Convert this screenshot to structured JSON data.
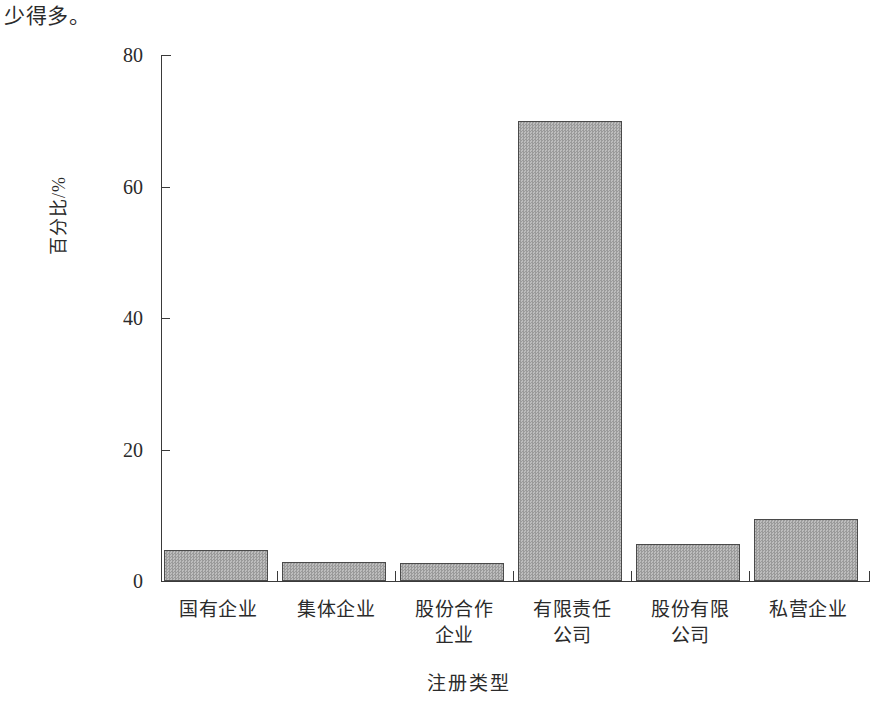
{
  "document": {
    "body_text": "少得多。"
  },
  "chart_data": {
    "type": "bar",
    "title": "",
    "xlabel": "注册类型",
    "ylabel": "百分比/%",
    "categories": [
      "国有企业",
      "集体企业",
      "股份合作企业",
      "有限责任公司",
      "股份有限公司",
      "私营企业"
    ],
    "category_lines": [
      [
        "国有企业"
      ],
      [
        "集体企业"
      ],
      [
        "股份合作",
        "企业"
      ],
      [
        "有限责任",
        "公司"
      ],
      [
        "股份有限",
        "公司"
      ],
      [
        "私营企业"
      ]
    ],
    "values": [
      4.7,
      2.9,
      2.8,
      70.0,
      5.6,
      9.4
    ],
    "ylim": [
      0,
      80
    ],
    "yticks": [
      0,
      20,
      40,
      60,
      80
    ],
    "ytick_labels": [
      "0",
      "20",
      "40",
      "60",
      "80"
    ],
    "grid": false,
    "legend": "none",
    "bar_fill": "#a9a9a9",
    "bar_edge": "#4a4a4a",
    "axis_color": "#3a3a3a"
  }
}
